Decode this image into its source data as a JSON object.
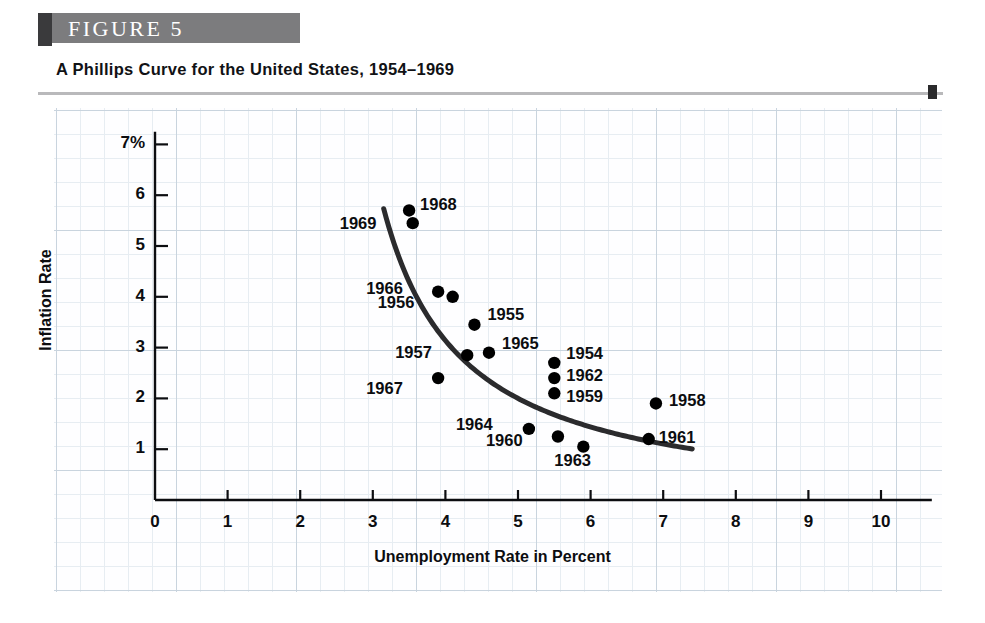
{
  "figure": {
    "badge_label": "FIGURE  5",
    "subtitle": "A Phillips Curve for the United States, 1954–1969"
  },
  "colors": {
    "badge_dark": "#3a3a3c",
    "badge_gray": "#7c7c7e",
    "grid_major": "#c9d4de",
    "grid_minor": "#e7edf2",
    "ink": "#0c0d10",
    "curve": "#2b2b2d",
    "point": "#000000"
  },
  "chart_data": {
    "type": "scatter",
    "title": "A Phillips Curve for the United States, 1954–1969",
    "xlabel": "Unemployment Rate in Percent",
    "ylabel": "Inflation Rate",
    "xlim": [
      0,
      10.8
    ],
    "ylim": [
      0,
      7.6
    ],
    "grid": true,
    "legend": "none",
    "x_ticks": [
      "0",
      "1",
      "2",
      "3",
      "4",
      "5",
      "6",
      "7",
      "8",
      "9",
      "10"
    ],
    "x_tick_values": [
      0,
      1,
      2,
      3,
      4,
      5,
      6,
      7,
      8,
      9,
      10
    ],
    "y_ticks": [
      "1",
      "2",
      "3",
      "4",
      "5",
      "6",
      "7%"
    ],
    "y_tick_values": [
      1,
      2,
      3,
      4,
      5,
      6,
      7
    ],
    "points": [
      {
        "label": "1954",
        "x": 5.5,
        "y": 2.7,
        "label_dx": 12,
        "label_dy": -9
      },
      {
        "label": "1955",
        "x": 4.4,
        "y": 3.45,
        "label_dx": 13,
        "label_dy": -10
      },
      {
        "label": "1956",
        "x": 4.1,
        "y": 4.0,
        "label_dx": -75,
        "label_dy": 6
      },
      {
        "label": "1957",
        "x": 4.3,
        "y": 2.85,
        "label_dx": -72,
        "label_dy": -2
      },
      {
        "label": "1958",
        "x": 6.9,
        "y": 1.9,
        "label_dx": 13,
        "label_dy": -2
      },
      {
        "label": "1959",
        "x": 5.5,
        "y": 2.1,
        "label_dx": 12,
        "label_dy": 4
      },
      {
        "label": "1960",
        "x": 5.55,
        "y": 1.25,
        "label_dx": -72,
        "label_dy": 4
      },
      {
        "label": "1961",
        "x": 6.8,
        "y": 1.2,
        "label_dx": 10,
        "label_dy": -1
      },
      {
        "label": "1962",
        "x": 5.5,
        "y": 2.4,
        "label_dx": 12,
        "label_dy": -2
      },
      {
        "label": "1963",
        "x": 5.9,
        "y": 1.05,
        "label_dx": -29,
        "label_dy": 14
      },
      {
        "label": "1964",
        "x": 5.15,
        "y": 1.4,
        "label_dx": -73,
        "label_dy": -4
      },
      {
        "label": "1965",
        "x": 4.6,
        "y": 2.9,
        "label_dx": 13,
        "label_dy": -9
      },
      {
        "label": "1966",
        "x": 3.9,
        "y": 4.1,
        "label_dx": -72,
        "label_dy": -3
      },
      {
        "label": "1967",
        "x": 3.9,
        "y": 2.4,
        "label_dx": -72,
        "label_dy": 11
      },
      {
        "label": "1968",
        "x": 3.5,
        "y": 5.7,
        "label_dx": 11,
        "label_dy": -5
      },
      {
        "label": "1969",
        "x": 3.55,
        "y": 5.45,
        "label_dx": -73,
        "label_dy": 1
      }
    ],
    "curve": {
      "name": "Phillips curve (fitted)",
      "description": "Downward-sloping convex curve fitted through the points",
      "from_x": 3.15,
      "to_x": 7.4
    }
  }
}
